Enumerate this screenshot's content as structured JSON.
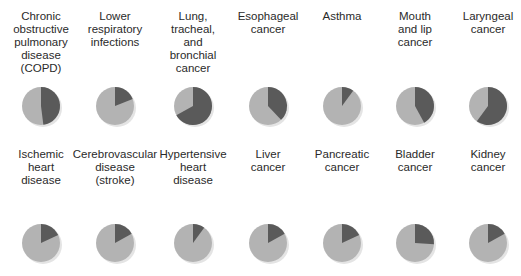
{
  "chart_data": {
    "type": "pie",
    "title": "",
    "layout": "small multiples, 2 rows x 7 columns",
    "slice_colors": {
      "dark": "#5a5a5a",
      "light": "#b3b3b3"
    },
    "charts": [
      {
        "label": "Chronic obstructive pulmonary disease (COPD)",
        "dark_fraction": 0.48,
        "light_fraction": 0.52
      },
      {
        "label": "Lower respiratory infections",
        "dark_fraction": 0.19,
        "light_fraction": 0.81
      },
      {
        "label": "Lung, tracheal, and bronchial cancer",
        "dark_fraction": 0.67,
        "light_fraction": 0.33
      },
      {
        "label": "Esophageal cancer",
        "dark_fraction": 0.38,
        "light_fraction": 0.62
      },
      {
        "label": "Asthma",
        "dark_fraction": 0.1,
        "light_fraction": 0.9
      },
      {
        "label": "Mouth and lip cancer",
        "dark_fraction": 0.42,
        "light_fraction": 0.58
      },
      {
        "label": "Laryngeal cancer",
        "dark_fraction": 0.6,
        "light_fraction": 0.4
      },
      {
        "label": "Ischemic heart disease",
        "dark_fraction": 0.18,
        "light_fraction": 0.82
      },
      {
        "label": "Cerebrovascular disease (stroke)",
        "dark_fraction": 0.17,
        "light_fraction": 0.83
      },
      {
        "label": "Hypertensive heart disease",
        "dark_fraction": 0.1,
        "light_fraction": 0.9
      },
      {
        "label": "Liver cancer",
        "dark_fraction": 0.17,
        "light_fraction": 0.83
      },
      {
        "label": "Pancreatic cancer",
        "dark_fraction": 0.18,
        "light_fraction": 0.82
      },
      {
        "label": "Bladder cancer",
        "dark_fraction": 0.26,
        "light_fraction": 0.74
      },
      {
        "label": "Kidney cancer",
        "dark_fraction": 0.17,
        "light_fraction": 0.83
      }
    ]
  },
  "labels": {
    "r1": [
      "Chronic\nobstructive\npulmonary\ndisease\n(COPD)",
      "Lower\nrespiratory\ninfections",
      "Lung,\ntracheal,\nand\nbronchial\ncancer",
      "Esophageal\ncancer",
      "Asthma",
      "Mouth\nand lip\ncancer",
      "Laryngeal\ncancer"
    ],
    "r2": [
      "Ischemic\nheart\ndisease",
      "Cerebrovascular\ndisease\n(stroke)",
      "Hypertensive\nheart\ndisease",
      "Liver\ncancer",
      "Pancreatic\ncancer",
      "Bladder\ncancer",
      "Kidney\ncancer"
    ]
  }
}
